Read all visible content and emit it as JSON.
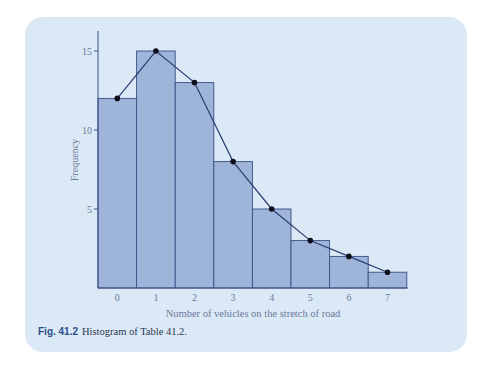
{
  "chart_data": {
    "type": "bar",
    "title": "",
    "xlabel": "Number of vehicles on the stretch of road",
    "ylabel": "Frequency",
    "categories": [
      "0",
      "1",
      "2",
      "3",
      "4",
      "5",
      "6",
      "7"
    ],
    "values": [
      12,
      15,
      13,
      8,
      5,
      3,
      2,
      1
    ],
    "overlay": {
      "type": "line",
      "name": "frequency polygon",
      "x": [
        0,
        1,
        2,
        3,
        4,
        5,
        6,
        7
      ],
      "y": [
        12,
        15,
        13,
        8,
        5,
        3,
        2,
        1
      ]
    },
    "yticks": [
      5,
      10,
      15
    ],
    "ylim": [
      0,
      16.5
    ],
    "grid": false,
    "legend": null
  },
  "figure": {
    "caption_label": "Fig. 41.2",
    "caption_text": "Histogram of Table 41.2."
  },
  "colors": {
    "panel_bg": "#dbe9f6",
    "bar_fill": "#9fb4d9",
    "bar_stroke": "#3a4f85",
    "axis": "#3a4f85",
    "line": "#2a3d70",
    "marker": "#0d0d1a",
    "tick_text": "#6a7a9a",
    "caption_label": "#2a4d8a"
  }
}
